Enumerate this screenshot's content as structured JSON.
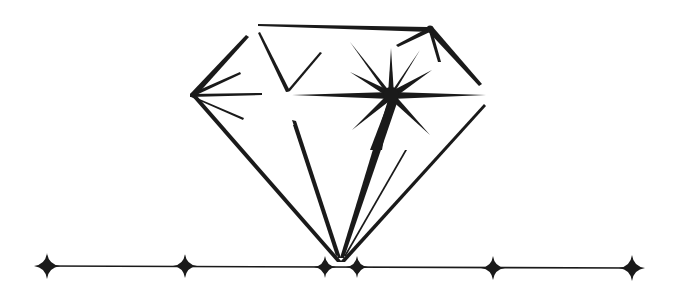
{
  "illustration": {
    "subject": "diamond",
    "colors": {
      "ink": "#1a1a1a",
      "background": "#ffffff"
    },
    "baseline": {
      "y": 266,
      "x_start": 45,
      "x_end": 632
    },
    "sparkles_on_baseline": [
      {
        "x": 47,
        "y": 266,
        "size": 13
      },
      {
        "x": 185,
        "y": 266,
        "size": 12
      },
      {
        "x": 325,
        "y": 267,
        "size": 11
      },
      {
        "x": 357,
        "y": 267,
        "size": 11
      },
      {
        "x": 493,
        "y": 268,
        "size": 12
      },
      {
        "x": 632,
        "y": 268,
        "size": 13
      }
    ],
    "main_sparkle": {
      "x": 391,
      "y": 95
    },
    "apex": {
      "x": 340,
      "y": 262
    }
  }
}
